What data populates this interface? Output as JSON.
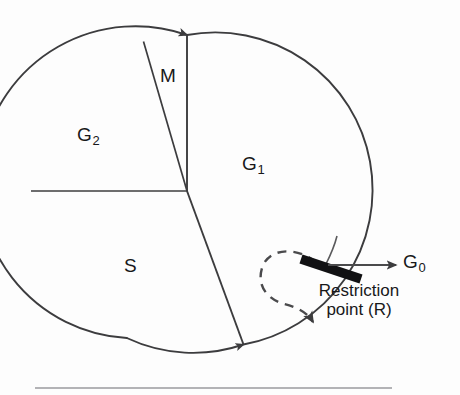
{
  "figure": {
    "type": "cell-cycle-circular-diagram"
  },
  "phases": [
    {
      "id": "M",
      "label": "M",
      "sub": "",
      "start_deg": 348,
      "end_deg": 90,
      "name": "mitosis-phase"
    },
    {
      "id": "G2",
      "label": "G",
      "sub": "2",
      "start_deg": 90,
      "end_deg": 180,
      "name": "g2-phase"
    },
    {
      "id": "S",
      "label": "S",
      "sub": "",
      "start_deg": 180,
      "end_deg": 249,
      "name": "s-phase"
    },
    {
      "id": "G1",
      "label": "G",
      "sub": "1",
      "start_deg": 249,
      "end_deg": 348,
      "name": "g1-phase"
    }
  ],
  "labels": {
    "m": "M",
    "g2_base": "G",
    "g2_sub": "2",
    "g1_base": "G",
    "g1_sub": "1",
    "s": "S",
    "g0_base": "G",
    "g0_sub": "0",
    "restriction_line1": "Restriction",
    "restriction_line2": "point (R)"
  },
  "geometry": {
    "circle_cx": 187,
    "circle_cy": 191,
    "circle_r": 156,
    "bar_angle_deg": 19,
    "g0_arrow_y": 265,
    "g0_arrow_x_start": 330,
    "g0_arrow_x_end": 398,
    "rule_y": 388,
    "rule_x_start": 35,
    "rule_x_end": 392
  },
  "colors": {
    "stroke": "#3c3c3e",
    "text": "#18181a",
    "bar": "#111113",
    "background": "#fdfdfd",
    "rule": "#9a9a9e"
  }
}
